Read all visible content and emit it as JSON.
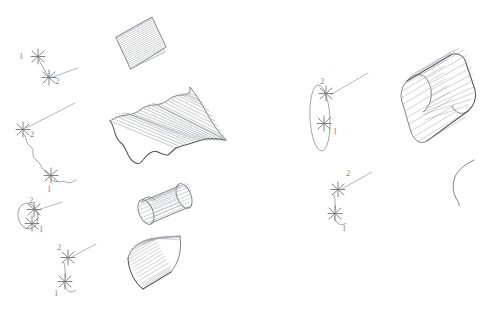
{
  "figure": {
    "background_color": "#ffffff",
    "line_color": "#8d8f94",
    "ruling_color": "#a9abb0",
    "outline_color": "#74767b",
    "label_color": "#86888d",
    "width": 489,
    "height": 309
  },
  "labels": {
    "one": "1",
    "two": "2"
  },
  "examples": [
    {
      "id": "example-a",
      "name": "two-straight-segments",
      "sketch": {
        "curve1_label": "1",
        "curve2_label": "2",
        "curve1_type": "line-segment",
        "curve2_type": "line-segment"
      },
      "surface": {
        "name": "planar-ruled-patch",
        "type": "flat-quadrilateral",
        "ruling_count": 22
      }
    },
    {
      "id": "example-b",
      "name": "two-wavy-curves",
      "sketch": {
        "curve1_label": "1",
        "curve2_label": "2",
        "curve1_type": "wavy-curve",
        "curve2_type": "wavy-curve"
      },
      "surface": {
        "name": "corrugated-ruled-sheet",
        "type": "wavy-surface",
        "ruling_count": 24
      }
    },
    {
      "id": "example-c",
      "name": "ellipse-and-line",
      "sketch": {
        "curve1_label": "1",
        "curve2_label": "2",
        "curve1_type": "ellipse",
        "curve2_type": "line-segment"
      },
      "surface": {
        "name": "cylinder-ruled-tube",
        "type": "small-cylinder",
        "ruling_count": 16
      }
    },
    {
      "id": "example-d",
      "name": "arc-and-line",
      "sketch": {
        "curve1_label": "1",
        "curve2_label": "2",
        "curve1_type": "small-arc",
        "curve2_type": "line-segment"
      },
      "surface": {
        "name": "curved-shell-ruled-sheet",
        "type": "curved-sheet",
        "ruling_count": 22
      }
    },
    {
      "id": "example-e",
      "name": "tall-ellipse-and-line",
      "sketch": {
        "curve1_label": "1",
        "curve2_label": "2",
        "curve1_type": "tall-ellipse",
        "curve2_type": "line-segment"
      },
      "surface": {
        "name": "rounded-rectangle-extrusion",
        "type": "tube-extrusion",
        "ruling_count": 20
      }
    },
    {
      "id": "example-f",
      "name": "s-curve-and-line",
      "sketch": {
        "curve1_label": "1",
        "curve2_label": "2",
        "curve1_type": "s-curve",
        "curve2_type": "line-segment"
      },
      "surface": {
        "name": "free-s-curve",
        "type": "open-curve",
        "ruling_count": 0
      }
    }
  ]
}
